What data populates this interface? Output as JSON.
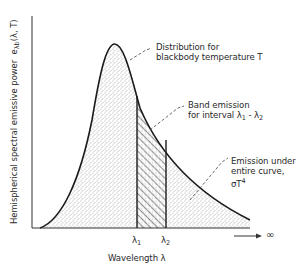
{
  "figure": {
    "type": "blackbody spectral emissive power diagram",
    "y_axis_label": "Hemispherical spectral emissive power",
    "y_axis_symbol": "e",
    "y_axis_symbol_sub": "λb",
    "y_axis_symbol_args": "(λ, T)",
    "x_axis_label": "Wavelength  λ",
    "x_axis_infinity": "∞",
    "ticks": {
      "lambda1": {
        "base": "λ",
        "sub": "1"
      },
      "lambda2": {
        "base": "λ",
        "sub": "2"
      }
    },
    "annotations": {
      "distribution": {
        "line1": "Distribution for",
        "line2": "blackbody temperature  T"
      },
      "band": {
        "line1": "Band emission",
        "line2_prefix": "for interval  ",
        "l1": "λ",
        "s1": "1",
        "dash": " - ",
        "l2": "λ",
        "s2": "2"
      },
      "total": {
        "line1": "Emission under",
        "line2": "entire curve,",
        "line3_base": "σT",
        "line3_sup": "4"
      }
    },
    "colors": {
      "stroke": "#1a1a1a",
      "stipple": "#555555",
      "text": "#2a2a2a"
    }
  }
}
